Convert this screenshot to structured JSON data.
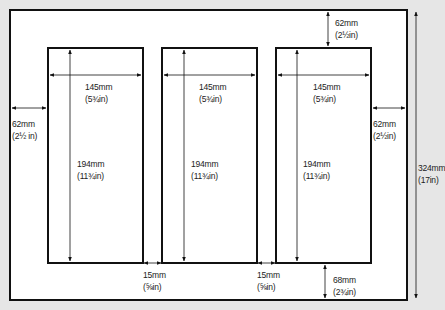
{
  "diagram": {
    "sheet": {
      "height_mm": "324mm",
      "height_in": "(17in)"
    },
    "margins": {
      "top": {
        "mm": "62mm",
        "in": "(2½in)"
      },
      "left": {
        "mm": "62mm",
        "in": "(2½ in)"
      },
      "right": {
        "mm": "62mm",
        "in": "(2½in)"
      },
      "bottom": {
        "mm": "68mm",
        "in": "(2¾in)"
      }
    },
    "gutters": [
      {
        "mm": "15mm",
        "in": "(⅝in)"
      },
      {
        "mm": "15mm",
        "in": "(⅝in)"
      }
    ],
    "panels": [
      {
        "width_mm": "145mm",
        "width_in": "(5¾in)",
        "height_mm": "194mm",
        "height_in": "(11¾in)"
      },
      {
        "width_mm": "145mm",
        "width_in": "(5¾in)",
        "height_mm": "194mm",
        "height_in": "(11¾in)"
      },
      {
        "width_mm": "145mm",
        "width_in": "(5¾in)",
        "height_mm": "194mm",
        "height_in": "(11¾in)"
      }
    ],
    "colors": {
      "background": "#e6e6e6",
      "sheet": "#ffffff",
      "line": "#111111"
    }
  }
}
